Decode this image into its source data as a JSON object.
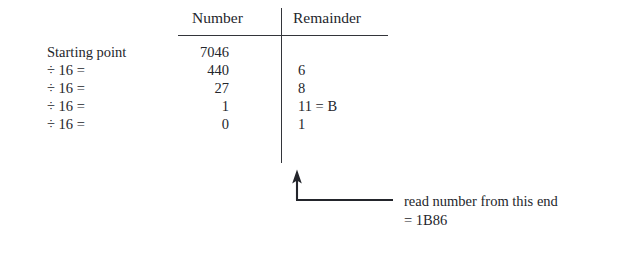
{
  "diagram": {
    "ink_color": "#24262c",
    "rule_color": "#33353a",
    "background_color": "#ffffff"
  },
  "table": {
    "headers": {
      "number": "Number",
      "remainder": "Remainder"
    },
    "rows": [
      {
        "label": "Starting point",
        "number": "7046",
        "remainder": ""
      },
      {
        "label": "÷ 16 =",
        "number": "440",
        "remainder": "6"
      },
      {
        "label": "÷ 16 =",
        "number": "27",
        "remainder": "8"
      },
      {
        "label": "÷ 16 =",
        "number": "1",
        "remainder": "11 = B"
      },
      {
        "label": "÷ 16 =",
        "number": "0",
        "remainder": "1"
      }
    ]
  },
  "annotation": {
    "arrow_name": "up-arrow-leader",
    "line_1": "read number from this end",
    "line_2": "= 1B86"
  }
}
